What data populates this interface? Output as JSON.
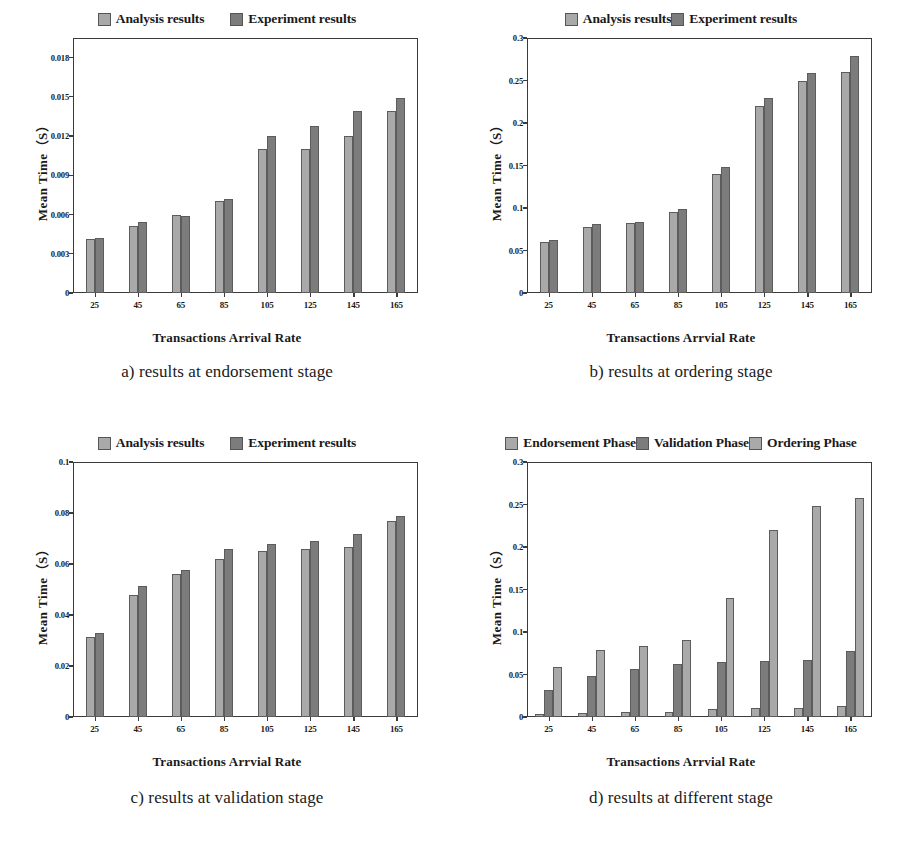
{
  "figure": {
    "panel_count": 4,
    "colors": {
      "series_light": "#a9a9a9",
      "series_dark": "#7c7c7c",
      "axis": "#3a3a3a",
      "background": "#ffffff",
      "text": "#1a1a1a"
    }
  },
  "chart_data": [
    {
      "id": "a",
      "type": "bar",
      "title": "",
      "caption": "a) results at endorsement stage",
      "xlabel": "Transactions Arrival Rate",
      "ylabel": "Mean Time（S）",
      "categories": [
        "25",
        "45",
        "65",
        "85",
        "105",
        "125",
        "145",
        "165"
      ],
      "yticks": [
        "0",
        "0.003",
        "0.006",
        "0.009",
        "0.012",
        "0.015",
        "0.018"
      ],
      "ytick_values": [
        0,
        0.003,
        0.006,
        0.009,
        0.012,
        0.015,
        0.018
      ],
      "ylim": [
        0,
        0.0195
      ],
      "grid": false,
      "legend_position": "top-center",
      "series": [
        {
          "name": "Analysis results",
          "color": "#a9a9a9",
          "values": [
            0.0041,
            0.0051,
            0.006,
            0.007,
            0.011,
            0.011,
            0.012,
            0.0139
          ]
        },
        {
          "name": "Experiment results",
          "color": "#7c7c7c",
          "values": [
            0.0042,
            0.0054,
            0.0059,
            0.0072,
            0.012,
            0.0128,
            0.0139,
            0.0149
          ]
        }
      ]
    },
    {
      "id": "b",
      "type": "bar",
      "title": "",
      "caption": "b) results at ordering stage",
      "xlabel": "Transactions Arrvial Rate",
      "ylabel": "Mean Time（S）",
      "categories": [
        "25",
        "45",
        "65",
        "85",
        "105",
        "125",
        "145",
        "165"
      ],
      "yticks": [
        "0",
        "0.05",
        "0.1",
        "0.15",
        "0.2",
        "0.25",
        "0.3"
      ],
      "ytick_values": [
        0,
        0.05,
        0.1,
        0.15,
        0.2,
        0.25,
        0.3
      ],
      "ylim": [
        0,
        0.3
      ],
      "grid": false,
      "legend_position": "top-center",
      "series": [
        {
          "name": "Analysis results",
          "color": "#a9a9a9",
          "values": [
            0.06,
            0.078,
            0.082,
            0.095,
            0.14,
            0.22,
            0.249,
            0.26
          ]
        },
        {
          "name": "Experiment results",
          "color": "#7c7c7c",
          "values": [
            0.062,
            0.081,
            0.084,
            0.099,
            0.148,
            0.23,
            0.259,
            0.279
          ]
        }
      ]
    },
    {
      "id": "c",
      "type": "bar",
      "title": "",
      "caption": "c) results at validation stage",
      "xlabel": "Transactions Arrvial Rate",
      "ylabel": "Mean Time（S）",
      "categories": [
        "25",
        "45",
        "65",
        "85",
        "105",
        "125",
        "145",
        "165"
      ],
      "yticks": [
        "0",
        "0.02",
        "0.04",
        "0.06",
        "0.08",
        "0.1"
      ],
      "ytick_values": [
        0,
        0.02,
        0.04,
        0.06,
        0.08,
        0.1
      ],
      "ylim": [
        0,
        0.1
      ],
      "grid": false,
      "legend_position": "top-center",
      "series": [
        {
          "name": "Analysis results",
          "color": "#a9a9a9",
          "values": [
            0.0315,
            0.048,
            0.056,
            0.062,
            0.065,
            0.0658,
            0.0668,
            0.0768
          ]
        },
        {
          "name": "Experiment results",
          "color": "#7c7c7c",
          "values": [
            0.0328,
            0.0512,
            0.0575,
            0.066,
            0.068,
            0.069,
            0.0718,
            0.079
          ]
        }
      ]
    },
    {
      "id": "d",
      "type": "bar",
      "title": "",
      "caption": "d) results at different stage",
      "xlabel": "Transactions Arrvial Rate",
      "ylabel": "Mean Time（S）",
      "categories": [
        "25",
        "45",
        "65",
        "85",
        "105",
        "125",
        "145",
        "165"
      ],
      "yticks": [
        "0",
        "0.05",
        "0.1",
        "0.15",
        "0.2",
        "0.25",
        "0.3"
      ],
      "ytick_values": [
        0,
        0.05,
        0.1,
        0.15,
        0.2,
        0.25,
        0.3
      ],
      "ylim": [
        0,
        0.3
      ],
      "grid": false,
      "legend_position": "top-center",
      "series": [
        {
          "name": "Endorsement Phase",
          "color": "#a9a9a9",
          "values": [
            0.004,
            0.005,
            0.0055,
            0.0063,
            0.01,
            0.0103,
            0.011,
            0.013
          ]
        },
        {
          "name": "Validation Phase",
          "color": "#7c7c7c",
          "values": [
            0.032,
            0.0485,
            0.056,
            0.062,
            0.065,
            0.0663,
            0.067,
            0.0775
          ]
        },
        {
          "name": "Ordering Phase",
          "color": "#a9a9a9",
          "values": [
            0.059,
            0.079,
            0.083,
            0.0905,
            0.14,
            0.2195,
            0.2485,
            0.258
          ]
        }
      ]
    }
  ]
}
